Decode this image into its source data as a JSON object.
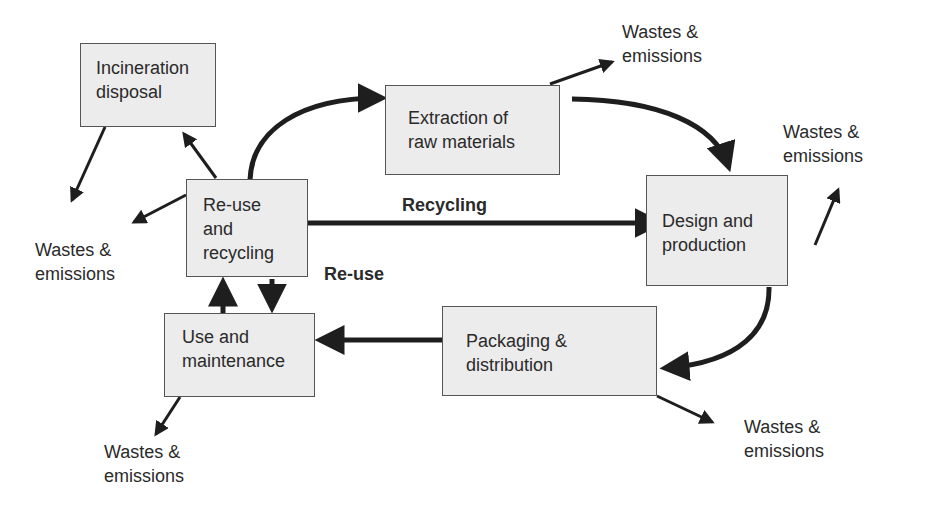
{
  "diagram": {
    "nodes": {
      "incineration": {
        "label": "Incineration\ndisposal"
      },
      "extraction": {
        "label": "Extraction of\nraw materials"
      },
      "reuse_recycling": {
        "label": "Re-use\nand\nrecycling"
      },
      "design": {
        "label": "Design and\nproduction"
      },
      "use": {
        "label": "Use and\nmaintenance"
      },
      "packaging": {
        "label": "Packaging &\ndistribution"
      }
    },
    "edge_labels": {
      "recycling": "Recycling",
      "reuse": "Re-use"
    },
    "wastes": {
      "top": "Wastes &\nemissions",
      "right": "Wastes &\nemissions",
      "left": "Wastes &\nemissions",
      "bottom_left": "Wastes &\nemissions",
      "bottom_right": "Wastes &\nemissions"
    },
    "colors": {
      "box_fill": "#ececec",
      "box_border": "#555555",
      "arrow": "#1e1e1e",
      "text": "#2a2a2a"
    }
  }
}
